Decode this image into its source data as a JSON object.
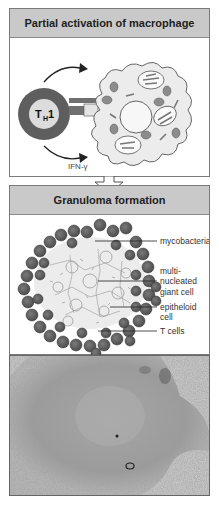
{
  "panels": [
    {
      "title": "Partial activation of macrophage",
      "labels": {
        "th_cell": "T",
        "th_sub": "H",
        "th_num": "1",
        "cytokine": "IFN-γ"
      }
    },
    {
      "title": "Granuloma formation",
      "labels": {
        "mycobacteria": "mycobacteria",
        "giant_cell_1": "multi-",
        "giant_cell_2": "nucleated",
        "giant_cell_3": "giant  cell",
        "epitheloid_1": "epitheloid",
        "epitheloid_2": "cell",
        "t_cells": "T  cells"
      }
    }
  ],
  "photo": {
    "description": "micrograph of granuloma tissue section"
  },
  "colors": {
    "header_bg": "#c9c9c9",
    "dark_cell": "#5e5e5e",
    "cytoplasm": "#ececec",
    "organelle": "#8c8c8c"
  }
}
